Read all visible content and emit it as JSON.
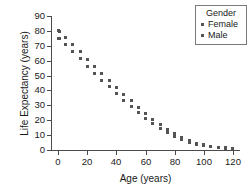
{
  "chart_data": {
    "type": "scatter",
    "title": "",
    "xlabel": "Age (years)",
    "ylabel": "Life Expectancy (years)",
    "xlim": [
      -5,
      125
    ],
    "ylim": [
      0,
      90
    ],
    "xticks": [
      0,
      20,
      40,
      60,
      80,
      100,
      120
    ],
    "yticks": [
      0,
      10,
      20,
      30,
      40,
      50,
      60,
      70,
      80,
      90
    ],
    "grid": false,
    "legend": {
      "title": "Gender",
      "position": "top-right",
      "entries": [
        "Female",
        "Male"
      ]
    },
    "x": [
      0,
      1,
      5,
      10,
      15,
      20,
      25,
      30,
      35,
      40,
      45,
      50,
      55,
      60,
      65,
      70,
      75,
      80,
      85,
      90,
      95,
      100,
      105,
      110,
      115,
      120
    ],
    "series": [
      {
        "name": "Female",
        "marker": "square",
        "color": "#545454",
        "values": [
          80.0,
          79.5,
          75.6,
          70.8,
          66.0,
          61.1,
          56.3,
          51.5,
          46.8,
          42.1,
          37.6,
          33.1,
          28.8,
          24.7,
          20.8,
          17.2,
          13.9,
          11.0,
          8.4,
          6.3,
          4.6,
          3.4,
          2.5,
          1.9,
          1.4,
          1.1
        ],
        "marker_offsets_px": []
      },
      {
        "name": "Male",
        "marker": "square",
        "color": "#545454",
        "values": [
          75.1,
          74.7,
          70.8,
          66.0,
          61.2,
          56.4,
          51.7,
          47.0,
          42.4,
          37.9,
          33.5,
          29.2,
          25.2,
          21.4,
          17.9,
          14.7,
          11.8,
          9.3,
          7.2,
          5.4,
          4.0,
          3.0,
          2.2,
          1.7,
          1.3,
          1.0
        ]
      }
    ],
    "annotations": []
  },
  "axis": {
    "x_ticklabels": [
      "0",
      "20",
      "40",
      "60",
      "80",
      "100",
      "120"
    ],
    "y_ticklabels": [
      "0",
      "10",
      "20",
      "30",
      "40",
      "50",
      "60",
      "70",
      "80",
      "90"
    ],
    "x_title": "Age (years)",
    "y_title": "Life Expectancy (years)"
  },
  "legend": {
    "title": "Gender",
    "female_label": "Female",
    "male_label": "Male"
  },
  "colors": {
    "marker": "#545454",
    "axis": "#4a4a4a",
    "text": "#1a1a1a",
    "legend_border": "#7a7a7a",
    "background": "#ffffff"
  }
}
